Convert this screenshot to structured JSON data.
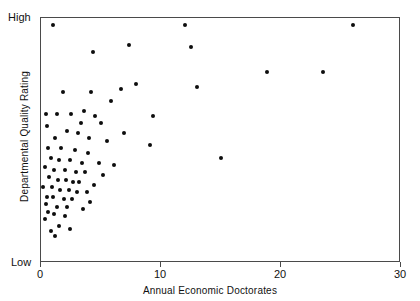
{
  "chart_data": {
    "type": "scatter",
    "title": "",
    "xlabel": "Annual Economic Doctorates",
    "ylabel": "Departmental Quality Rating",
    "xlim": [
      0,
      30
    ],
    "ylim": [
      0,
      100
    ],
    "xticks": [
      0,
      10,
      20,
      30
    ],
    "xtick_labels": [
      "0",
      "10",
      "20",
      "30"
    ],
    "ytick_labels": [
      "Low",
      "High"
    ],
    "y_axis_low_label": "Low",
    "y_axis_high_label": "High",
    "grid": false,
    "legend": null,
    "marker_color": "#0d0d0d",
    "frame_color": "#4a4a4a",
    "background_color": "#ffffff",
    "n_points": 76,
    "points": [
      [
        1.0,
        97
      ],
      [
        12.0,
        97
      ],
      [
        26.0,
        97
      ],
      [
        7.3,
        89
      ],
      [
        12.5,
        88
      ],
      [
        4.3,
        86
      ],
      [
        18.8,
        78
      ],
      [
        23.5,
        78
      ],
      [
        13.0,
        72
      ],
      [
        7.9,
        73
      ],
      [
        1.8,
        70
      ],
      [
        4.2,
        70
      ],
      [
        6.7,
        71
      ],
      [
        5.8,
        66
      ],
      [
        0.4,
        61
      ],
      [
        1.3,
        61
      ],
      [
        2.5,
        61
      ],
      [
        3.6,
        62
      ],
      [
        4.5,
        60
      ],
      [
        9.3,
        60
      ],
      [
        3.3,
        57
      ],
      [
        5.0,
        57
      ],
      [
        0.5,
        56
      ],
      [
        2.2,
        54
      ],
      [
        3.1,
        53
      ],
      [
        6.9,
        53
      ],
      [
        1.2,
        51
      ],
      [
        4.0,
        51
      ],
      [
        5.5,
        50
      ],
      [
        9.1,
        48
      ],
      [
        0.6,
        47
      ],
      [
        1.7,
        47
      ],
      [
        2.8,
        46
      ],
      [
        3.9,
        45
      ],
      [
        15.0,
        43
      ],
      [
        0.8,
        43
      ],
      [
        1.5,
        42
      ],
      [
        2.4,
        42
      ],
      [
        3.4,
        41
      ],
      [
        4.8,
        41
      ],
      [
        6.1,
        40
      ],
      [
        0.3,
        39
      ],
      [
        1.1,
        38
      ],
      [
        2.0,
        38
      ],
      [
        2.9,
        37
      ],
      [
        3.7,
        37
      ],
      [
        5.2,
        36
      ],
      [
        0.7,
        35
      ],
      [
        1.4,
        34
      ],
      [
        2.1,
        34
      ],
      [
        2.7,
        33
      ],
      [
        3.2,
        33
      ],
      [
        4.4,
        32
      ],
      [
        0.2,
        31
      ],
      [
        0.9,
        31
      ],
      [
        1.6,
        30
      ],
      [
        2.3,
        30
      ],
      [
        3.0,
        29
      ],
      [
        3.8,
        29
      ],
      [
        0.5,
        27
      ],
      [
        1.0,
        27
      ],
      [
        1.9,
        26
      ],
      [
        2.6,
        26
      ],
      [
        4.1,
        25
      ],
      [
        0.4,
        24
      ],
      [
        1.3,
        23
      ],
      [
        2.2,
        23
      ],
      [
        3.5,
        22
      ],
      [
        0.6,
        21
      ],
      [
        1.1,
        20
      ],
      [
        2.0,
        19
      ],
      [
        0.3,
        18
      ],
      [
        1.5,
        15
      ],
      [
        2.4,
        14
      ],
      [
        0.8,
        13
      ],
      [
        1.2,
        11
      ]
    ]
  }
}
